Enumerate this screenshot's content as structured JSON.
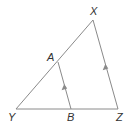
{
  "diagram": {
    "type": "triangle-with-parallel-segment",
    "colors": {
      "line": "#8a8a8a",
      "arrow": "#8a8a8a",
      "label": "#333333"
    },
    "points": {
      "X": {
        "label": "X",
        "x": 93,
        "y": 20
      },
      "Y": {
        "label": "Y",
        "x": 16,
        "y": 109
      },
      "Z": {
        "label": "Z",
        "x": 118,
        "y": 109
      },
      "A": {
        "label": "A",
        "x": 58,
        "y": 62
      },
      "B": {
        "label": "B",
        "x": 71,
        "y": 109
      }
    },
    "segments": [
      {
        "name": "XY",
        "from": "X",
        "to": "Y"
      },
      {
        "name": "YZ",
        "from": "Y",
        "to": "Z"
      },
      {
        "name": "XZ",
        "from": "X",
        "to": "Z",
        "parallel_mark": true
      },
      {
        "name": "AB",
        "from": "A",
        "to": "B",
        "parallel_mark": true
      }
    ],
    "relations": [
      "AB ∥ XZ"
    ]
  }
}
